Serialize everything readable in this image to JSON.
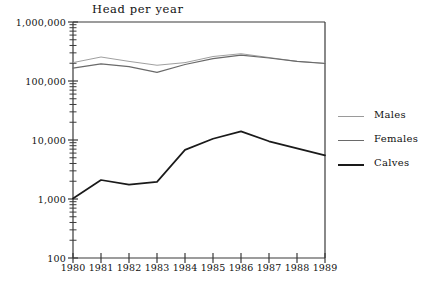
{
  "chart_data": {
    "type": "line",
    "title": "Head per year",
    "xlabel": "",
    "ylabel": "",
    "yscale": "log",
    "ylim": [
      100,
      1000000
    ],
    "grid": false,
    "legend_position": "right",
    "x": [
      1980,
      1981,
      1982,
      1983,
      1984,
      1985,
      1986,
      1987,
      1988,
      1989
    ],
    "categories": [
      "1980",
      "1981",
      "1982",
      "1983",
      "1984",
      "1985",
      "1986",
      "1987",
      "1988",
      "1989"
    ],
    "ytick_labels": [
      "1,000,000",
      "100,000",
      "10,000",
      "1,000",
      "100"
    ],
    "ytick_values": [
      1000000,
      100000,
      10000,
      1000,
      100
    ],
    "series": [
      {
        "name": "Males",
        "color": "#9a9a9a",
        "values": [
          205000,
          255000,
          215000,
          185000,
          205000,
          260000,
          290000,
          250000,
          215000,
          200000
        ]
      },
      {
        "name": "Females",
        "color": "#6a6a6a",
        "values": [
          165000,
          195000,
          175000,
          140000,
          190000,
          240000,
          275000,
          245000,
          215000,
          198000
        ]
      },
      {
        "name": "Calves",
        "color": "#1a1a1a",
        "values": [
          1020,
          2100,
          1750,
          1950,
          6800,
          10500,
          14000,
          9500,
          7200,
          5500
        ]
      }
    ]
  },
  "axes": {
    "minor_ticks_per_decade": [
      2,
      3,
      4,
      5,
      6,
      7,
      8,
      9
    ]
  },
  "legend": {
    "items": [
      {
        "label": "Males",
        "color": "#9a9a9a",
        "thickness": 1
      },
      {
        "label": "Females",
        "color": "#6a6a6a",
        "thickness": 1.4
      },
      {
        "label": "Calves",
        "color": "#1a1a1a",
        "thickness": 2
      }
    ]
  },
  "frame": {
    "color": "#3a3a3a"
  }
}
